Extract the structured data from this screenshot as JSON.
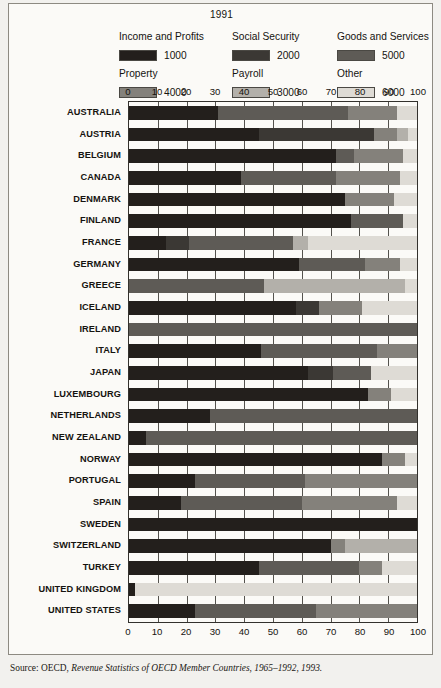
{
  "figure": {
    "title": "1991",
    "source_prefix": "Source: OECD, ",
    "source_italic": "Revenue Statistics of OECD Member Countries, 1965–1992, 1993."
  },
  "legend": {
    "entries": [
      {
        "label": "Income and Profits",
        "code": "1000",
        "color": "#231f1c"
      },
      {
        "label": "Social Security",
        "code": "2000",
        "color": "#3b3834"
      },
      {
        "label": "Goods and Services",
        "code": "5000",
        "color": "#5e5b56"
      },
      {
        "label": "Property",
        "code": "4000",
        "color": "#84817b"
      },
      {
        "label": "Payroll",
        "code": "3000",
        "color": "#b3b0aa"
      },
      {
        "label": "Other",
        "code": "6000",
        "color": "#dedbd5"
      }
    ]
  },
  "chart_data": {
    "type": "bar",
    "orientation": "horizontal",
    "stacked": true,
    "title": "1991",
    "xlabel": "",
    "ylabel": "",
    "xlim": [
      0,
      100
    ],
    "xticks": [
      0,
      10,
      20,
      30,
      40,
      50,
      60,
      70,
      80,
      90,
      100
    ],
    "grid": true,
    "legend_position": "top",
    "series": [
      {
        "name": "Income and Profits",
        "code": "1000",
        "color": "#231f1c"
      },
      {
        "name": "Social Security",
        "code": "2000",
        "color": "#3b3834"
      },
      {
        "name": "Goods and Services",
        "code": "5000",
        "color": "#5e5b56"
      },
      {
        "name": "Property",
        "code": "4000",
        "color": "#84817b"
      },
      {
        "name": "Payroll",
        "code": "3000",
        "color": "#b3b0aa"
      },
      {
        "name": "Other",
        "code": "6000",
        "color": "#dedbd5"
      }
    ],
    "categories": [
      "AUSTRALIA",
      "AUSTRIA",
      "BELGIUM",
      "CANADA",
      "DENMARK",
      "FINLAND",
      "FRANCE",
      "GERMANY",
      "GREECE",
      "ICELAND",
      "IRELAND",
      "ITALY",
      "JAPAN",
      "LUXEMBOURG",
      "NETHERLANDS",
      "NEW ZEALAND",
      "NORWAY",
      "PORTUGAL",
      "SPAIN",
      "SWEDEN",
      "SWITZERLAND",
      "TURKEY",
      "UNITED KINGDOM",
      "UNITED STATES"
    ],
    "rows": [
      {
        "country": "AUSTRALIA",
        "segments": [
          {
            "code": "1000",
            "value": 31
          },
          {
            "code": "5000",
            "value": 45
          },
          {
            "code": "4000",
            "value": 17
          },
          {
            "code": "6000",
            "value": 7
          }
        ]
      },
      {
        "country": "AUSTRIA",
        "segments": [
          {
            "code": "1000",
            "value": 45
          },
          {
            "code": "2000",
            "value": 40
          },
          {
            "code": "4000",
            "value": 8
          },
          {
            "code": "3000",
            "value": 4
          },
          {
            "code": "6000",
            "value": 3
          }
        ]
      },
      {
        "country": "BELGIUM",
        "segments": [
          {
            "code": "1000",
            "value": 72
          },
          {
            "code": "5000",
            "value": 6
          },
          {
            "code": "4000",
            "value": 17
          },
          {
            "code": "6000",
            "value": 5
          }
        ]
      },
      {
        "country": "CANADA",
        "segments": [
          {
            "code": "1000",
            "value": 39
          },
          {
            "code": "5000",
            "value": 33
          },
          {
            "code": "4000",
            "value": 22
          },
          {
            "code": "6000",
            "value": 6
          }
        ]
      },
      {
        "country": "DENMARK",
        "segments": [
          {
            "code": "1000",
            "value": 75
          },
          {
            "code": "4000",
            "value": 17
          },
          {
            "code": "6000",
            "value": 8
          }
        ]
      },
      {
        "country": "FINLAND",
        "segments": [
          {
            "code": "1000",
            "value": 77
          },
          {
            "code": "5000",
            "value": 18
          },
          {
            "code": "6000",
            "value": 5
          }
        ]
      },
      {
        "country": "FRANCE",
        "segments": [
          {
            "code": "1000",
            "value": 13
          },
          {
            "code": "2000",
            "value": 8
          },
          {
            "code": "5000",
            "value": 36
          },
          {
            "code": "3000",
            "value": 5
          },
          {
            "code": "6000",
            "value": 38
          }
        ]
      },
      {
        "country": "GERMANY",
        "segments": [
          {
            "code": "1000",
            "value": 59
          },
          {
            "code": "5000",
            "value": 23
          },
          {
            "code": "4000",
            "value": 12
          },
          {
            "code": "6000",
            "value": 6
          }
        ]
      },
      {
        "country": "GREECE",
        "segments": [
          {
            "code": "5000",
            "value": 47
          },
          {
            "code": "3000",
            "value": 49
          },
          {
            "code": "6000",
            "value": 4
          }
        ]
      },
      {
        "country": "ICELAND",
        "segments": [
          {
            "code": "1000",
            "value": 58
          },
          {
            "code": "2000",
            "value": 8
          },
          {
            "code": "4000",
            "value": 15
          },
          {
            "code": "6000",
            "value": 19
          }
        ]
      },
      {
        "country": "IRELAND",
        "segments": [
          {
            "code": "5000",
            "value": 100
          }
        ]
      },
      {
        "country": "ITALY",
        "segments": [
          {
            "code": "1000",
            "value": 46
          },
          {
            "code": "5000",
            "value": 40
          },
          {
            "code": "4000",
            "value": 14
          }
        ]
      },
      {
        "country": "JAPAN",
        "segments": [
          {
            "code": "1000",
            "value": 62
          },
          {
            "code": "2000",
            "value": 9
          },
          {
            "code": "5000",
            "value": 13
          },
          {
            "code": "6000",
            "value": 16
          }
        ]
      },
      {
        "country": "LUXEMBOURG",
        "segments": [
          {
            "code": "1000",
            "value": 83
          },
          {
            "code": "4000",
            "value": 8
          },
          {
            "code": "6000",
            "value": 9
          }
        ]
      },
      {
        "country": "NETHERLANDS",
        "segments": [
          {
            "code": "1000",
            "value": 28
          },
          {
            "code": "5000",
            "value": 72
          }
        ]
      },
      {
        "country": "NEW ZEALAND",
        "segments": [
          {
            "code": "1000",
            "value": 6
          },
          {
            "code": "5000",
            "value": 94
          }
        ]
      },
      {
        "country": "NORWAY",
        "segments": [
          {
            "code": "1000",
            "value": 88
          },
          {
            "code": "4000",
            "value": 8
          },
          {
            "code": "6000",
            "value": 4
          }
        ]
      },
      {
        "country": "PORTUGAL",
        "segments": [
          {
            "code": "1000",
            "value": 23
          },
          {
            "code": "5000",
            "value": 38
          },
          {
            "code": "4000",
            "value": 39
          }
        ]
      },
      {
        "country": "SPAIN",
        "segments": [
          {
            "code": "1000",
            "value": 18
          },
          {
            "code": "5000",
            "value": 42
          },
          {
            "code": "4000",
            "value": 33
          },
          {
            "code": "6000",
            "value": 7
          }
        ]
      },
      {
        "country": "SWEDEN",
        "segments": [
          {
            "code": "1000",
            "value": 100
          }
        ]
      },
      {
        "country": "SWITZERLAND",
        "segments": [
          {
            "code": "1000",
            "value": 70
          },
          {
            "code": "4000",
            "value": 5
          },
          {
            "code": "3000",
            "value": 25
          }
        ]
      },
      {
        "country": "TURKEY",
        "segments": [
          {
            "code": "1000",
            "value": 45
          },
          {
            "code": "5000",
            "value": 35
          },
          {
            "code": "4000",
            "value": 8
          },
          {
            "code": "6000",
            "value": 12
          }
        ]
      },
      {
        "country": "UNITED KINGDOM",
        "segments": [
          {
            "code": "1000",
            "value": 2
          },
          {
            "code": "6000",
            "value": 98
          }
        ]
      },
      {
        "country": "UNITED STATES",
        "segments": [
          {
            "code": "1000",
            "value": 23
          },
          {
            "code": "5000",
            "value": 42
          },
          {
            "code": "4000",
            "value": 35
          }
        ]
      }
    ]
  }
}
